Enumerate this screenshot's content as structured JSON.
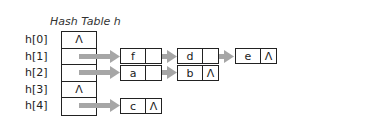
{
  "diagram": {
    "title": "Hash Table h",
    "null_symbol": "Λ",
    "arrow_color": "#a6a6a6",
    "slots": [
      {
        "label": "h[0]",
        "content": "Λ"
      },
      {
        "label": "h[1]",
        "content": ""
      },
      {
        "label": "h[2]",
        "content": ""
      },
      {
        "label": "h[3]",
        "content": "Λ"
      },
      {
        "label": "h[4]",
        "content": ""
      }
    ],
    "chains": {
      "h1": [
        {
          "value": "f",
          "next": ""
        },
        {
          "value": "d",
          "next": ""
        },
        {
          "value": "e",
          "next": "Λ"
        }
      ],
      "h2": [
        {
          "value": "a",
          "next": ""
        },
        {
          "value": "b",
          "next": "Λ"
        }
      ],
      "h4": [
        {
          "value": "c",
          "next": "Λ"
        }
      ]
    }
  }
}
